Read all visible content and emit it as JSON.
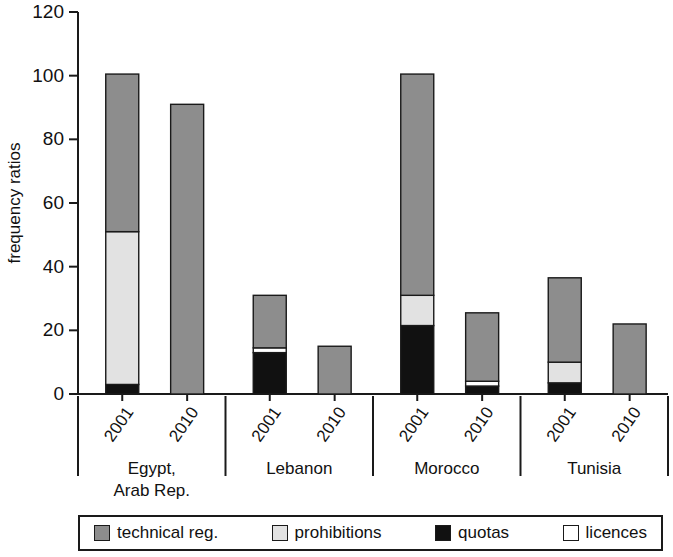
{
  "chart_data": {
    "type": "bar",
    "subtype": "stacked",
    "title": "",
    "xlabel": "",
    "ylabel": "frequency ratios",
    "ylim": [
      0,
      120
    ],
    "yticks": [
      0,
      20,
      40,
      60,
      80,
      100,
      120
    ],
    "ytick_labels": [
      "0",
      "20",
      "40",
      "60",
      "80",
      "100",
      "120"
    ],
    "grid": false,
    "legend_position": "bottom",
    "x": [
      "2001",
      "2010",
      "2001",
      "2010",
      "2001",
      "2010",
      "2001",
      "2010"
    ],
    "groups": [
      {
        "label": "Egypt,\nArab Rep.",
        "label_lines": [
          "Egypt,",
          "Arab Rep."
        ],
        "years": [
          "2001",
          "2010"
        ]
      },
      {
        "label": "Lebanon",
        "label_lines": [
          "Lebanon"
        ],
        "years": [
          "2001",
          "2010"
        ]
      },
      {
        "label": "Morocco",
        "label_lines": [
          "Morocco"
        ],
        "years": [
          "2001",
          "2010"
        ]
      },
      {
        "label": "Tunisia",
        "label_lines": [
          "Tunisia"
        ],
        "years": [
          "2001",
          "2010"
        ]
      }
    ],
    "series": [
      {
        "name": "quotas",
        "color": "#111111",
        "values": [
          3,
          0,
          13,
          0,
          21.5,
          2.5,
          3.5,
          0
        ]
      },
      {
        "name": "licences",
        "color": "#ffffff",
        "values": [
          0,
          0,
          1.5,
          0,
          0,
          1.5,
          0,
          0
        ]
      },
      {
        "name": "prohibitions",
        "color": "#e2e2e2",
        "values": [
          48,
          0,
          0,
          0,
          9.5,
          0,
          6.5,
          0
        ]
      },
      {
        "name": "technical reg.",
        "color": "#8d8d8d",
        "values": [
          49.5,
          91,
          16.5,
          15,
          69.5,
          21.5,
          26.5,
          22
        ]
      }
    ],
    "stack_order_bottom_to_top": [
      "quotas",
      "licences",
      "prohibitions",
      "technical reg."
    ],
    "totals": [
      100.5,
      91,
      31,
      15,
      100.5,
      25.5,
      36.5,
      22
    ],
    "bars": [
      {
        "group": "Egypt, Arab Rep.",
        "year": "2001",
        "segments": [
          {
            "name": "quotas",
            "from": 0,
            "to": 3
          },
          {
            "name": "prohibitions",
            "from": 3,
            "to": 51
          },
          {
            "name": "technical reg.",
            "from": 51,
            "to": 100.5
          }
        ],
        "total": 100.5
      },
      {
        "group": "Egypt, Arab Rep.",
        "year": "2010",
        "segments": [
          {
            "name": "technical reg.",
            "from": 0,
            "to": 91
          }
        ],
        "total": 91
      },
      {
        "group": "Lebanon",
        "year": "2001",
        "segments": [
          {
            "name": "quotas",
            "from": 0,
            "to": 13
          },
          {
            "name": "licences",
            "from": 13,
            "to": 14.5
          },
          {
            "name": "technical reg.",
            "from": 14.5,
            "to": 31
          }
        ],
        "total": 31
      },
      {
        "group": "Lebanon",
        "year": "2010",
        "segments": [
          {
            "name": "technical reg.",
            "from": 0,
            "to": 15
          }
        ],
        "total": 15
      },
      {
        "group": "Morocco",
        "year": "2001",
        "segments": [
          {
            "name": "quotas",
            "from": 0,
            "to": 21.5
          },
          {
            "name": "prohibitions",
            "from": 21.5,
            "to": 31
          },
          {
            "name": "technical reg.",
            "from": 31,
            "to": 100.5
          }
        ],
        "total": 100.5
      },
      {
        "group": "Morocco",
        "year": "2010",
        "segments": [
          {
            "name": "quotas",
            "from": 0,
            "to": 2.5
          },
          {
            "name": "licences",
            "from": 2.5,
            "to": 4
          },
          {
            "name": "technical reg.",
            "from": 4,
            "to": 25.5
          }
        ],
        "total": 25.5
      },
      {
        "group": "Tunisia",
        "year": "2001",
        "segments": [
          {
            "name": "quotas",
            "from": 0,
            "to": 3.5
          },
          {
            "name": "prohibitions",
            "from": 3.5,
            "to": 10
          },
          {
            "name": "technical reg.",
            "from": 10,
            "to": 36.5
          }
        ],
        "total": 36.5
      },
      {
        "group": "Tunisia",
        "year": "2010",
        "segments": [
          {
            "name": "technical reg.",
            "from": 0,
            "to": 22
          }
        ],
        "total": 22
      }
    ]
  },
  "legend": {
    "items": [
      {
        "label": "technical reg.",
        "color": "#8d8d8d"
      },
      {
        "label": "prohibitions",
        "color": "#e2e2e2"
      },
      {
        "label": "quotas",
        "color": "#111111"
      },
      {
        "label": "licences",
        "color": "#ffffff"
      }
    ]
  },
  "axis": {
    "y_title": "frequency ratios"
  }
}
